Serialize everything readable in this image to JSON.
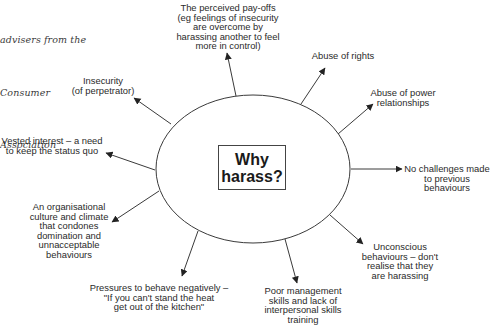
{
  "caption": {
    "lines": [
      "advisers from the",
      "Consumer",
      "Association"
    ]
  },
  "center": {
    "title": "Why\nharass?"
  },
  "colors": {
    "line": "#3a3a3a",
    "text": "#2a2a2a",
    "background": "#ffffff"
  },
  "ellipse": {
    "cx": 253,
    "cy": 169,
    "rx": 97,
    "ry": 74
  },
  "reasons": [
    {
      "id": "payoffs",
      "text": "The perceived pay-offs\n(eg feelings of insecurity\nare overcome by\nharassing another to feel\nmore in control)",
      "x": 228,
      "y": 3,
      "arrow": [
        236,
        96,
        227,
        53
      ]
    },
    {
      "id": "abuse-rights",
      "text": "Abuse of rights",
      "x": 343,
      "y": 51,
      "arrow": [
        301,
        104,
        325,
        68
      ]
    },
    {
      "id": "abuse-power",
      "text": "Abuse of power\nrelationships",
      "x": 403,
      "y": 88,
      "arrow": [
        338,
        134,
        373,
        104
      ]
    },
    {
      "id": "no-challenges",
      "text": "No challenges made\nto previous\nbehaviours",
      "x": 447,
      "y": 164,
      "arrow": [
        351,
        169,
        402,
        169
      ]
    },
    {
      "id": "unconscious",
      "text": "Unconscious\nbehaviours – don't\nrealise that they\nare harassing",
      "x": 400,
      "y": 242,
      "arrow": [
        330,
        215,
        363,
        244
      ]
    },
    {
      "id": "poor-management",
      "text": "Poor management\nskills and lack of\ninterpersonal skills\ntraining",
      "x": 303,
      "y": 286,
      "arrow": [
        285,
        239,
        297,
        283
      ]
    },
    {
      "id": "pressures",
      "text": "Pressures to behave negatively –\n\"If you can't stand the heat\nget out of the kitchen\"",
      "x": 159,
      "y": 283,
      "arrow": [
        198,
        231,
        182,
        276
      ]
    },
    {
      "id": "organisational",
      "text": "An organisational\nculture and climate\nthat condones\ndomination and\nunnacceptable\nbehaviours",
      "x": 69,
      "y": 202,
      "arrow": [
        159,
        191,
        112,
        222
      ]
    },
    {
      "id": "vested-interest",
      "text": "Vested interest – a need\nto keep the status quo",
      "x": 52,
      "y": 136,
      "arrow": [
        155,
        170,
        106,
        153
      ]
    },
    {
      "id": "insecurity",
      "text": "Insecurity\n(of perpetrator)",
      "x": 103,
      "y": 76,
      "arrow": [
        171,
        124,
        134,
        98
      ]
    }
  ]
}
